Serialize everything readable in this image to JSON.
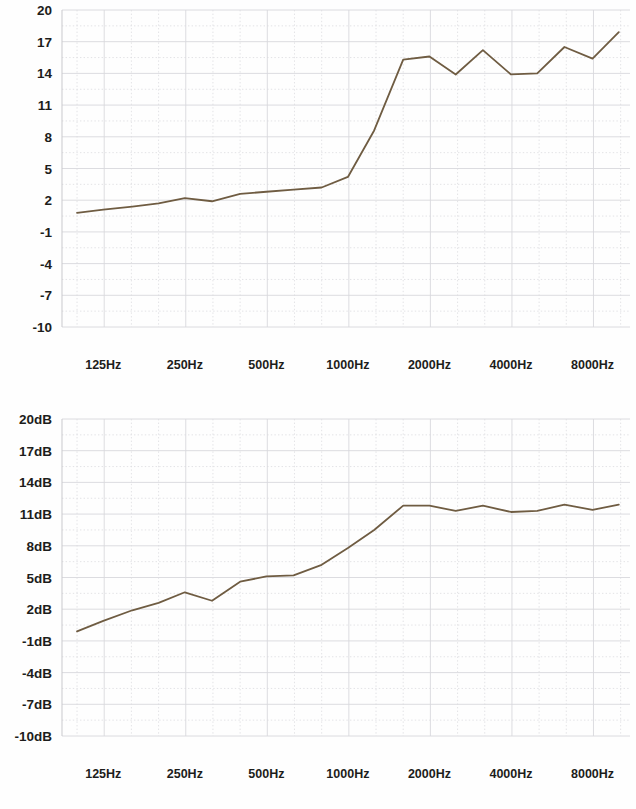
{
  "page": {
    "background_color": "#fefefe",
    "line_color": "#6f5c42",
    "grid_color": "#d8d8dc",
    "text_color": "#1d1d1b"
  },
  "charts": [
    {
      "id": "chart-top",
      "name": "frequency-response-chart-top",
      "chart_data": {
        "type": "line",
        "title": "",
        "subtitle": "",
        "xlabel": "",
        "ylabel": "",
        "grid": true,
        "legend": "none",
        "xlim": [
          88,
          11000
        ],
        "ylim": [
          -10,
          20
        ],
        "yticks": [
          "20",
          "17",
          "14",
          "11",
          "8",
          "5",
          "2",
          "-1",
          "-4",
          "-7",
          "-10"
        ],
        "ytick_values": [
          20,
          17,
          14,
          11,
          8,
          5,
          2,
          -1,
          -4,
          -7,
          -10
        ],
        "xticks": [
          "125Hz",
          "250Hz",
          "500Hz",
          "1000Hz",
          "2000Hz",
          "4000Hz",
          "8000Hz"
        ],
        "xtick_values": [
          125,
          250,
          500,
          1000,
          2000,
          4000,
          8000
        ],
        "series": [
          {
            "name": "response",
            "color": "#6f5c42",
            "x": [
              100,
              125,
              160,
              200,
              250,
              315,
              400,
              500,
              630,
              800,
              1000,
              1250,
              1600,
              2000,
              2500,
              3150,
              4000,
              5000,
              6300,
              8000,
              10000
            ],
            "values": [
              0.8,
              1.1,
              1.4,
              1.7,
              2.2,
              1.9,
              2.6,
              2.8,
              3.0,
              3.2,
              4.2,
              8.6,
              15.3,
              15.6,
              13.9,
              16.2,
              13.9,
              14.0,
              16.5,
              15.4,
              17.9
            ]
          }
        ]
      }
    },
    {
      "id": "chart-bottom",
      "name": "frequency-response-chart-bottom",
      "chart_data": {
        "type": "line",
        "title": "",
        "subtitle": "",
        "xlabel": "",
        "ylabel": "",
        "grid": true,
        "legend": "none",
        "xlim": [
          88,
          11000
        ],
        "ylim": [
          -10,
          20
        ],
        "yticks": [
          "20dB",
          "17dB",
          "14dB",
          "11dB",
          "8dB",
          "5dB",
          "2dB",
          "-1dB",
          "-4dB",
          "-7dB",
          "-10dB"
        ],
        "ytick_values": [
          20,
          17,
          14,
          11,
          8,
          5,
          2,
          -1,
          -4,
          -7,
          -10
        ],
        "xticks": [
          "125Hz",
          "250Hz",
          "500Hz",
          "1000Hz",
          "2000Hz",
          "4000Hz",
          "8000Hz"
        ],
        "xtick_values": [
          125,
          250,
          500,
          1000,
          2000,
          4000,
          8000
        ],
        "series": [
          {
            "name": "response",
            "color": "#6f5c42",
            "x": [
              100,
              125,
              160,
              200,
              250,
              315,
              400,
              500,
              630,
              800,
              1000,
              1250,
              1600,
              2000,
              2500,
              3150,
              4000,
              5000,
              6300,
              8000,
              10000
            ],
            "values": [
              -0.1,
              0.9,
              1.9,
              2.6,
              3.6,
              2.8,
              4.6,
              5.1,
              5.2,
              6.2,
              7.8,
              9.5,
              11.8,
              11.8,
              11.3,
              11.8,
              11.2,
              11.3,
              11.9,
              11.4,
              11.9
            ]
          }
        ]
      }
    }
  ]
}
